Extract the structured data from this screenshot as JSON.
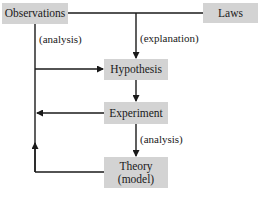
{
  "nodes": {
    "observations": "Observations",
    "laws": "Laws",
    "hypothesis": "Hypothesis",
    "experiment": "Experiment",
    "theory_line1": "Theory",
    "theory_line2": "(model)"
  },
  "edge_labels": {
    "observations_analysis": "(analysis)",
    "laws_explanation": "(explanation)",
    "experiment_analysis": "(analysis)"
  },
  "colors": {
    "box_fill": "#d3d3d3",
    "line": "#1a1a1a",
    "background": "#ffffff"
  }
}
